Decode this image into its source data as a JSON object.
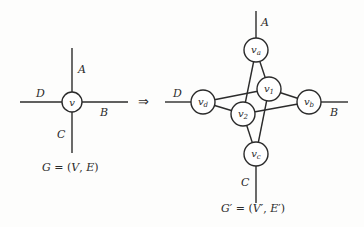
{
  "diagram": {
    "left_graph": {
      "caption": "G = (V, E)",
      "caption_parts": {
        "G": "G",
        "eq": " = (",
        "V": "V",
        "comma": ", ",
        "E": "E",
        "close": ")"
      },
      "vertex": {
        "id": "v",
        "label": "v",
        "x": 72,
        "y": 102,
        "r": 10
      },
      "edges": [
        {
          "label": "A",
          "direction": "up"
        },
        {
          "label": "B",
          "direction": "right"
        },
        {
          "label": "C",
          "direction": "down"
        },
        {
          "label": "D",
          "direction": "left"
        }
      ],
      "labels": {
        "A": "A",
        "B": "B",
        "C": "C",
        "D": "D"
      }
    },
    "transform_symbol": "⇒",
    "right_graph": {
      "caption": "G' = (V', E')",
      "caption_parts": {
        "G": "G",
        "prime": "′",
        "eq": " = (",
        "V": "V",
        "comma": ", ",
        "E": "E",
        "close": ")"
      },
      "vertices": [
        {
          "id": "va",
          "base": "v",
          "sub": "a",
          "x": 256,
          "y": 50,
          "r": 12
        },
        {
          "id": "v1",
          "base": "v",
          "sub": "1",
          "x": 269,
          "y": 89,
          "r": 12
        },
        {
          "id": "vb",
          "base": "v",
          "sub": "b",
          "x": 309,
          "y": 102,
          "r": 12
        },
        {
          "id": "vd",
          "base": "v",
          "sub": "d",
          "x": 203,
          "y": 102,
          "r": 12
        },
        {
          "id": "v2",
          "base": "v",
          "sub": "2",
          "x": 243,
          "y": 114,
          "r": 12
        },
        {
          "id": "vc",
          "base": "v",
          "sub": "c",
          "x": 256,
          "y": 154,
          "r": 12
        }
      ],
      "internal_edges": [
        [
          "va",
          "v1"
        ],
        [
          "va",
          "v2"
        ],
        [
          "vd",
          "v1"
        ],
        [
          "vd",
          "v2"
        ],
        [
          "v1",
          "vb"
        ],
        [
          "v2",
          "vb"
        ],
        [
          "v1",
          "vc"
        ],
        [
          "v2",
          "vc"
        ]
      ],
      "external_edges": [
        {
          "label": "A",
          "from": "va"
        },
        {
          "label": "B",
          "from": "vb"
        },
        {
          "label": "C",
          "from": "vc"
        },
        {
          "label": "D",
          "from": "vd"
        }
      ],
      "labels": {
        "A": "A",
        "B": "B",
        "C": "C",
        "D": "D"
      }
    }
  }
}
